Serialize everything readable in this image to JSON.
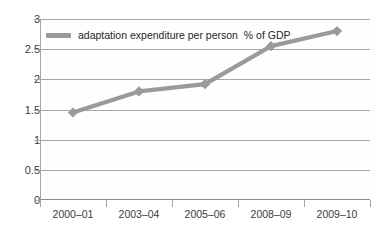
{
  "chart_data": {
    "type": "line",
    "title": "",
    "xlabel": "",
    "ylabel": "",
    "categories": [
      "2000–01",
      "2003–04",
      "2005–06",
      "2008–09",
      "2009–10"
    ],
    "series": [
      {
        "name": "adaptation expenditure per person  % of GDP",
        "values": [
          1.45,
          1.8,
          1.92,
          2.55,
          2.8
        ]
      }
    ],
    "ylim": [
      0,
      3
    ],
    "ytick_labels": [
      "0",
      "0.5",
      "1",
      "1.5",
      "2",
      "2.5",
      "3"
    ],
    "ytick_values": [
      0,
      0.5,
      1,
      1.5,
      2,
      2.5,
      3
    ],
    "grid": true,
    "legend_position": "top-left-inside",
    "series_color": "#9a9a9a",
    "marker": "diamond",
    "axis_color": "#a6a6a6"
  },
  "legend": {
    "label": "adaptation expenditure per person  % of GDP"
  }
}
